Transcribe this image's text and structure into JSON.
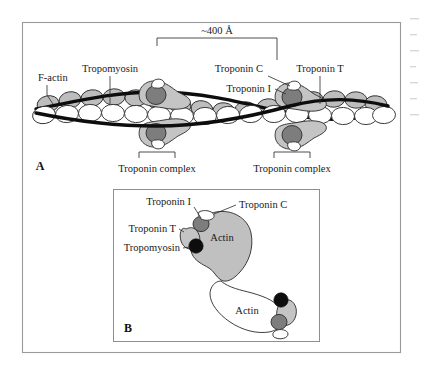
{
  "figure": {
    "panels": [
      {
        "id": "A",
        "label": "A",
        "labels": {
          "scale": "~400 Å",
          "f_actin": "F-actin",
          "tropomyosin": "Tropomyosin",
          "troponin_c": "Troponin C",
          "troponin_t": "Troponin T",
          "troponin_i": "Troponin I",
          "troponin_complex_left": "Troponin complex",
          "troponin_complex_right": "Troponin complex"
        }
      },
      {
        "id": "B",
        "label": "B",
        "labels": {
          "troponin_i": "Troponin I",
          "troponin_c": "Troponin C",
          "troponin_t": "Troponin T",
          "tropomyosin": "Tropomyosin",
          "actin_upper": "Actin",
          "actin_lower": "Actin"
        }
      }
    ]
  },
  "colors": {
    "background": "#ffffff",
    "frame": "#9a9a9a",
    "ink": "#1a1a1a",
    "tropomyosin_strand": "#0d0d0d",
    "actin_back": "#bdbdbd",
    "actin_front": "#ffffff",
    "troponin_c": "#ffffff",
    "troponin_t": "#c4c4c4",
    "troponin_i": "#7d7d7d"
  }
}
